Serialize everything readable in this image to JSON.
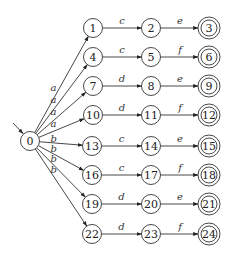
{
  "diagram": {
    "type": "NFA / trie automaton",
    "start_state": "0",
    "states": [
      {
        "id": "0",
        "x": 30,
        "y": 141,
        "accepting": false
      },
      {
        "id": "1",
        "x": 93,
        "y": 28,
        "accepting": false
      },
      {
        "id": "2",
        "x": 151,
        "y": 28,
        "accepting": false
      },
      {
        "id": "3",
        "x": 209,
        "y": 28,
        "accepting": true
      },
      {
        "id": "4",
        "x": 93,
        "y": 57,
        "accepting": false
      },
      {
        "id": "5",
        "x": 151,
        "y": 57,
        "accepting": false
      },
      {
        "id": "6",
        "x": 209,
        "y": 57,
        "accepting": true
      },
      {
        "id": "7",
        "x": 93,
        "y": 86,
        "accepting": false
      },
      {
        "id": "8",
        "x": 151,
        "y": 86,
        "accepting": false
      },
      {
        "id": "9",
        "x": 209,
        "y": 86,
        "accepting": true
      },
      {
        "id": "10",
        "x": 93,
        "y": 115,
        "accepting": false
      },
      {
        "id": "11",
        "x": 151,
        "y": 115,
        "accepting": false
      },
      {
        "id": "12",
        "x": 209,
        "y": 115,
        "accepting": true
      },
      {
        "id": "13",
        "x": 92,
        "y": 146,
        "accepting": false
      },
      {
        "id": "14",
        "x": 151,
        "y": 146,
        "accepting": false
      },
      {
        "id": "15",
        "x": 209,
        "y": 146,
        "accepting": true
      },
      {
        "id": "16",
        "x": 92,
        "y": 175,
        "accepting": false
      },
      {
        "id": "17",
        "x": 151,
        "y": 175,
        "accepting": false
      },
      {
        "id": "18",
        "x": 209,
        "y": 175,
        "accepting": true
      },
      {
        "id": "19",
        "x": 92,
        "y": 204,
        "accepting": false
      },
      {
        "id": "20",
        "x": 151,
        "y": 204,
        "accepting": false
      },
      {
        "id": "21",
        "x": 209,
        "y": 204,
        "accepting": true
      },
      {
        "id": "22",
        "x": 92,
        "y": 234,
        "accepting": false
      },
      {
        "id": "23",
        "x": 151,
        "y": 234,
        "accepting": false
      },
      {
        "id": "24",
        "x": 209,
        "y": 234,
        "accepting": true
      }
    ],
    "transitions": [
      {
        "from": "0",
        "to": "1",
        "label": "a"
      },
      {
        "from": "0",
        "to": "4",
        "label": "a"
      },
      {
        "from": "0",
        "to": "7",
        "label": "a"
      },
      {
        "from": "0",
        "to": "10",
        "label": "a"
      },
      {
        "from": "0",
        "to": "13",
        "label": "b"
      },
      {
        "from": "0",
        "to": "16",
        "label": "b"
      },
      {
        "from": "0",
        "to": "19",
        "label": "b"
      },
      {
        "from": "0",
        "to": "22",
        "label": "b"
      },
      {
        "from": "1",
        "to": "2",
        "label": "c"
      },
      {
        "from": "2",
        "to": "3",
        "label": "e"
      },
      {
        "from": "4",
        "to": "5",
        "label": "c"
      },
      {
        "from": "5",
        "to": "6",
        "label": "f"
      },
      {
        "from": "7",
        "to": "8",
        "label": "d"
      },
      {
        "from": "8",
        "to": "9",
        "label": "e"
      },
      {
        "from": "10",
        "to": "11",
        "label": "d"
      },
      {
        "from": "11",
        "to": "12",
        "label": "f"
      },
      {
        "from": "13",
        "to": "14",
        "label": "c"
      },
      {
        "from": "14",
        "to": "15",
        "label": "e"
      },
      {
        "from": "16",
        "to": "17",
        "label": "c"
      },
      {
        "from": "17",
        "to": "18",
        "label": "f"
      },
      {
        "from": "19",
        "to": "20",
        "label": "d"
      },
      {
        "from": "20",
        "to": "21",
        "label": "e"
      },
      {
        "from": "22",
        "to": "23",
        "label": "d"
      },
      {
        "from": "23",
        "to": "24",
        "label": "f"
      }
    ]
  }
}
